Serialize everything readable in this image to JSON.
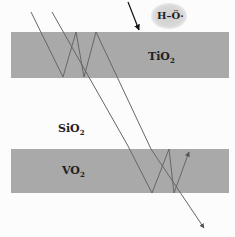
{
  "diagram": {
    "layers": [
      {
        "name": "TiO2",
        "label": "TiO",
        "subscript": "2",
        "color": "#a9a9a9"
      },
      {
        "name": "SiO2",
        "label": "SiO",
        "subscript": "2",
        "color": "#fcfcfc"
      },
      {
        "name": "VO2",
        "label": "VO",
        "subscript": "2",
        "color": "#a9a9a9"
      }
    ],
    "radical": {
      "label": "H–Ö·",
      "description": "hydroxyl radical"
    },
    "rays": {
      "color": "#666666",
      "incoming_arrow": "arrow pointing onto TiO2 surface",
      "exit_arrows": 2
    }
  }
}
